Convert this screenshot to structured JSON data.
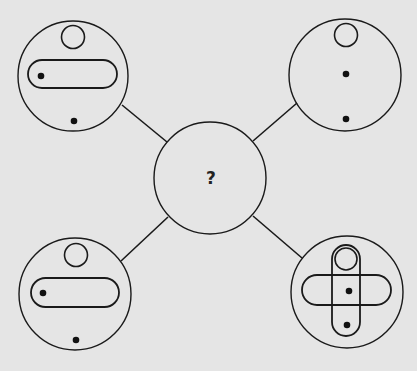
{
  "puzzle": {
    "type": "visual-logic-puzzle",
    "center": {
      "label": "?"
    },
    "colors": {
      "background": "#e5e5e5",
      "ink": "#1a1a1a"
    },
    "panels": [
      {
        "position": "top-left",
        "elements": [
          "small-circle-top",
          "horizontal-pill",
          "dot-inside-pill-left",
          "dot-bottom"
        ]
      },
      {
        "position": "top-right",
        "elements": [
          "small-circle-top",
          "dot-center",
          "dot-bottom"
        ]
      },
      {
        "position": "bottom-left",
        "elements": [
          "small-circle-top",
          "horizontal-pill",
          "dot-inside-pill-left",
          "dot-bottom"
        ]
      },
      {
        "position": "bottom-right",
        "elements": [
          "vertical-pill",
          "small-circle-inside-vertical-pill",
          "horizontal-pill",
          "dot-center",
          "dot-bottom-inside-vertical-pill"
        ]
      }
    ]
  }
}
